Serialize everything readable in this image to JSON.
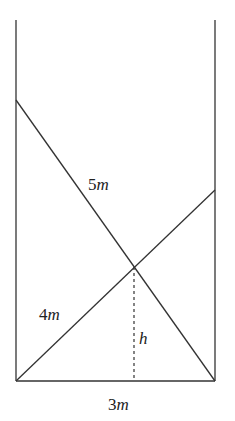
{
  "diagram": {
    "labels": {
      "ladder_long": {
        "num": "5",
        "unit": "m"
      },
      "ladder_short": {
        "num": "4",
        "unit": "m"
      },
      "height": "h",
      "width": {
        "num": "3",
        "unit": "m"
      }
    },
    "colors": {
      "line": "#333333",
      "background": "#ffffff"
    }
  }
}
